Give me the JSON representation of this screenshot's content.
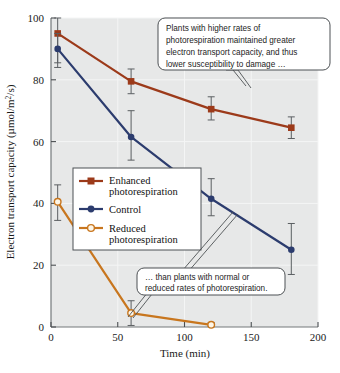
{
  "chart_data": {
    "type": "line",
    "title": "",
    "xlabel": "Time (min)",
    "ylabel": "Electron transport capacity (µmol/m²/s)",
    "xlim": [
      0,
      200
    ],
    "ylim": [
      0,
      100
    ],
    "xticks": [
      0,
      50,
      100,
      150,
      200
    ],
    "yticks": [
      0,
      20,
      40,
      60,
      80,
      100
    ],
    "grid": true,
    "legend_position": "center-left",
    "series": [
      {
        "name": "Enhanced photorespiration",
        "color": "#9c3a1a",
        "marker": "filled-square",
        "x": [
          5,
          60,
          120,
          180
        ],
        "values": [
          95,
          79.5,
          70.5,
          64.5
        ],
        "err_low": [
          85.5,
          75.5,
          67,
          61
        ],
        "err_high": [
          100,
          83.5,
          74.5,
          68
        ]
      },
      {
        "name": "Control",
        "color": "#2c3c6e",
        "marker": "filled-circle",
        "x": [
          5,
          60,
          120,
          180
        ],
        "values": [
          90,
          61.5,
          41.5,
          25
        ],
        "err_low": [
          84,
          54,
          36,
          17
        ],
        "err_high": [
          95,
          70,
          48,
          33.5
        ]
      },
      {
        "name": "Reduced photorespiration",
        "color": "#c8761e",
        "marker": "open-circle",
        "x": [
          5,
          60,
          120
        ],
        "values": [
          40.5,
          4.5,
          0.7
        ],
        "err_low": [
          34.5,
          0.5,
          0.2
        ],
        "err_high": [
          46,
          8.5,
          1.4
        ]
      }
    ]
  },
  "axes": {
    "y_label_text": "Electron transport capacity (µmol/m",
    "y_label_sup": "2",
    "y_label_tail": "/s)",
    "x_label": "Time (min)",
    "x_ticks": [
      "0",
      "50",
      "100",
      "150",
      "200"
    ],
    "y_ticks": [
      "0",
      "20",
      "40",
      "60",
      "80",
      "100"
    ]
  },
  "legend": {
    "entries": [
      {
        "label_line1": "Enhanced",
        "label_line2": "photorespiration"
      },
      {
        "label_line1": "Control",
        "label_line2": ""
      },
      {
        "label_line1": "Reduced",
        "label_line2": "photorespiration"
      }
    ]
  },
  "callouts": {
    "top": {
      "lines": [
        "Plants with higher rates of",
        "photorespiration maintained greater",
        "electron transport capacity, and thus",
        "lower susceptibility to damage …"
      ]
    },
    "bottom": {
      "lines": [
        "… than plants with normal or",
        "reduced rates of photorespiration."
      ]
    }
  },
  "colors": {
    "enhanced": "#9c3a1a",
    "control": "#2c3c6e",
    "reduced": "#c8761e",
    "plot_background": "#e7e8e8",
    "gridline": "#f2f3f3",
    "axis": "#6f7376",
    "errorbar": "#5b5f62"
  }
}
